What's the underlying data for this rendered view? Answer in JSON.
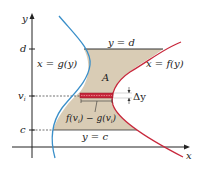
{
  "diagram": {
    "axes": {
      "x_label": "x",
      "y_label": "y"
    },
    "y_ticks": {
      "d": "d",
      "v_i": "v",
      "v_i_sub": "i",
      "c": "c"
    },
    "curves": {
      "left": {
        "label": "x = g(y)",
        "color": "#3a8fc9"
      },
      "right": {
        "label": "x = f(y)",
        "color": "#c8283c"
      }
    },
    "boundaries": {
      "top": "y = d",
      "bottom": "y = c"
    },
    "region": {
      "label": "A",
      "fill": "#d9ccb5"
    },
    "strip": {
      "color": "#c8283c",
      "width_label_f": "f(v",
      "width_label_f_sub": "i",
      "width_label_mid": ") − g(v",
      "width_label_g_sub": "i",
      "width_label_end": ")",
      "height_label": "Δy"
    }
  }
}
